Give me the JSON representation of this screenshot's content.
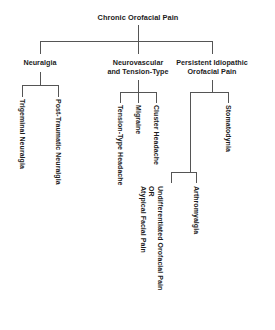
{
  "diagram": {
    "title": "Chronic Orofacial Pain",
    "type": "tree-hierarchy",
    "root": {
      "label": "Chronic Orofacial Pain"
    },
    "level2": {
      "neuralgia": "Neuralgia",
      "neurovascular": "Neurovascular\nand Tension-Type",
      "persistent": "Persistent Idiopathic\nOrofacial Pain"
    },
    "leaves": {
      "trigeminal_neuralgia": "Trigeminal Neuralgia",
      "post_traumatic_neuralgia": "Post-Traumatic Neuralgia",
      "tension_type_headache": "Tension-Type Headache",
      "migraine": "Migraine",
      "cluster_headache": "Cluster Headache",
      "stomatodynia": "Stomatodynia",
      "arthromyalgia": "Arthromyalgia",
      "atypical_facial_pain": "Atypical Facial Pain",
      "or_connector": "OR",
      "undifferentiated_orofacial_pain": "Undifferentiated Orofacial Pain"
    },
    "colors": {
      "line": "#555555",
      "text": "#1c1c1c",
      "background": "#ffffff"
    }
  }
}
